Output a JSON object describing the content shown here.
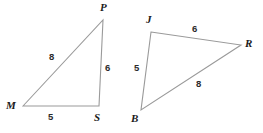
{
  "figure": {
    "background_color": "#ffffff",
    "stroke_color": "#9a9a9a",
    "label_color": "#1a1a1a",
    "width": 263,
    "height": 133
  },
  "shapes": [
    {
      "name": "triangle-mps",
      "vertices": [
        {
          "label": "M",
          "x": 23,
          "y": 106,
          "label_x": 6,
          "label_y": 100
        },
        {
          "label": "P",
          "x": 103,
          "y": 20,
          "label_x": 100,
          "label_y": 2
        },
        {
          "label": "S",
          "x": 99,
          "y": 106,
          "label_x": 94,
          "label_y": 112
        }
      ],
      "sides": [
        {
          "name": "MP",
          "length": "8",
          "label_x": 49,
          "label_y": 52
        },
        {
          "name": "PS",
          "length": "6",
          "label_x": 105,
          "label_y": 63
        },
        {
          "name": "MS",
          "length": "5",
          "label_x": 48,
          "label_y": 112
        }
      ]
    },
    {
      "name": "triangle-jbr",
      "vertices": [
        {
          "label": "J",
          "x": 151,
          "y": 32,
          "label_x": 146,
          "label_y": 14
        },
        {
          "label": "R",
          "x": 241,
          "y": 45,
          "label_x": 245,
          "label_y": 38
        },
        {
          "label": "B",
          "x": 141,
          "y": 110,
          "label_x": 131,
          "label_y": 113
        }
      ],
      "sides": [
        {
          "name": "JR",
          "length": "6",
          "label_x": 192,
          "label_y": 24
        },
        {
          "name": "JB",
          "length": "5",
          "label_x": 134,
          "label_y": 63
        },
        {
          "name": "BR",
          "length": "8",
          "label_x": 196,
          "label_y": 79
        }
      ]
    }
  ]
}
